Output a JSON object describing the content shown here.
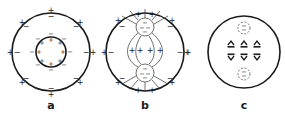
{
  "panels": [
    {
      "id": "a",
      "label": "a",
      "description": "Outer circle with + outside / − inside charges; inner concentric circle with − outside / + inside charges"
    },
    {
      "id": "b",
      "label": "b",
      "description": "Outer circle with paired charges; two small negatively charged circles top and bottom linked by field lines; row of + charges across the middle"
    },
    {
      "id": "c",
      "label": "c",
      "description": "Outer circle containing two dashed small circles with − charges and two rows of three dipole glyphs"
    }
  ],
  "symbols": {
    "plus": "+",
    "minus": "−"
  },
  "colors": {
    "line": "#1a1a1a",
    "background": "#ffffff"
  }
}
